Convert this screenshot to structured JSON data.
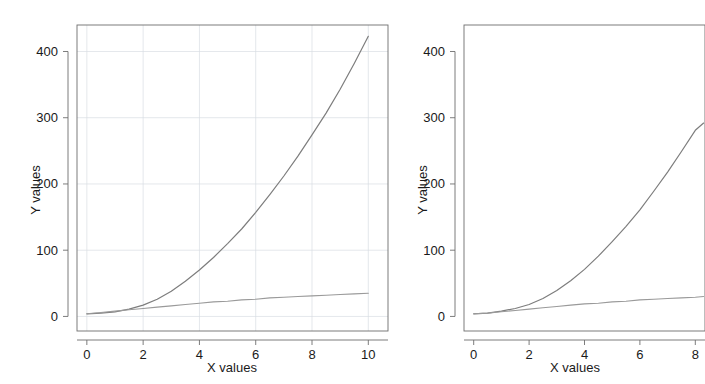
{
  "figure": {
    "background_color": "#ffffff",
    "panel_count": 2
  },
  "chart_data": [
    {
      "id": "left",
      "type": "line",
      "title": "",
      "xlabel": "X values",
      "ylabel": "Y values",
      "xlim": [
        -0.35,
        10.7
      ],
      "ylim": [
        -22,
        440
      ],
      "xticks": [
        0,
        2,
        4,
        6,
        8,
        10
      ],
      "xticklabels": [
        "0",
        "2",
        "4",
        "6",
        "8",
        "10"
      ],
      "yticks": [
        0,
        100,
        200,
        300,
        400
      ],
      "yticklabels": [
        "0",
        "100",
        "200",
        "300",
        "400"
      ],
      "grid": true,
      "grid_color": "#d9dde2",
      "frame": true,
      "frame_color": "#6e6e6e",
      "legend": "none",
      "x": [
        0,
        0.5,
        1,
        1.5,
        2,
        2.5,
        3,
        3.5,
        4,
        4.5,
        5,
        5.5,
        6,
        6.5,
        7,
        7.5,
        8,
        8.5,
        9,
        9.5,
        10
      ],
      "series": [
        {
          "name": "quadratic",
          "color": "#7d7d7d",
          "width": 1.2,
          "values": [
            4,
            5,
            7,
            11,
            17,
            26,
            38,
            53,
            70,
            89,
            110,
            132,
            157,
            184,
            212,
            242,
            274,
            307,
            343,
            382,
            423
          ]
        },
        {
          "name": "linear",
          "color": "#9a9a9a",
          "width": 1.1,
          "values": [
            4,
            6,
            8,
            10,
            12,
            14,
            16,
            18,
            20,
            22,
            23,
            25,
            26,
            28,
            29,
            30,
            31,
            32,
            33,
            34,
            35
          ]
        }
      ]
    },
    {
      "id": "right",
      "type": "line",
      "title": "",
      "xlabel": "X values",
      "ylabel": "Y values",
      "xlim": [
        -0.35,
        8.35
      ],
      "ylim": [
        -22,
        440
      ],
      "xticks": [
        0,
        2,
        4,
        6,
        8
      ],
      "xticklabels": [
        "0",
        "2",
        "4",
        "6",
        "8"
      ],
      "yticks": [
        0,
        100,
        200,
        300,
        400
      ],
      "yticklabels": [
        "0",
        "100",
        "200",
        "300",
        "400"
      ],
      "grid": false,
      "frame": true,
      "frame_color": "#6e6e6e",
      "legend": "none",
      "clipped_right_edge": true,
      "x": [
        0,
        0.5,
        1,
        1.5,
        2,
        2.5,
        3,
        3.5,
        4,
        4.5,
        5,
        5.5,
        6,
        6.5,
        7,
        7.5,
        8,
        8.3
      ],
      "series": [
        {
          "name": "quadratic",
          "color": "#7d7d7d",
          "width": 1.2,
          "values": [
            4,
            5,
            8,
            12,
            18,
            27,
            39,
            54,
            71,
            91,
            113,
            136,
            161,
            189,
            218,
            249,
            281,
            292
          ]
        },
        {
          "name": "linear",
          "color": "#9a9a9a",
          "width": 1.1,
          "values": [
            4,
            5,
            7,
            9,
            11,
            13,
            15,
            17,
            19,
            20,
            22,
            23,
            25,
            26,
            27,
            28,
            29,
            30
          ]
        }
      ]
    }
  ]
}
